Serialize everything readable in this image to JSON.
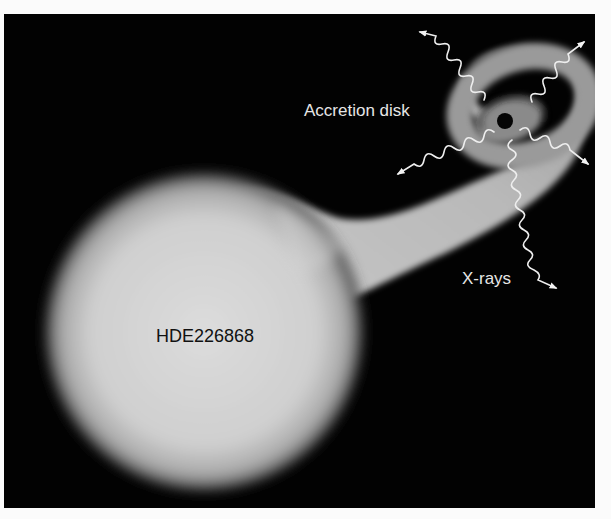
{
  "diagram": {
    "labels": {
      "accretion_disk": "Accretion disk",
      "xrays": "X-rays",
      "star": "HDE226868"
    },
    "elements": {
      "star": "HDE226868 supergiant star (large glowing sphere)",
      "stream": "gas stream flowing from star to accretion disk",
      "accretion_disk": "spiral accretion disk",
      "black_hole": "compact object at disk center",
      "xray_arrows": [
        "upper-left",
        "upper-right",
        "lower-left",
        "right",
        "down"
      ]
    },
    "colors": {
      "background": "#020202",
      "border": "#fbfbfb",
      "star_core": "#d8d8d8",
      "disk": "#a8a8a8",
      "arrow": "#f0f0f0",
      "label_light": "#e6e6e6",
      "label_dark": "#111111"
    }
  }
}
